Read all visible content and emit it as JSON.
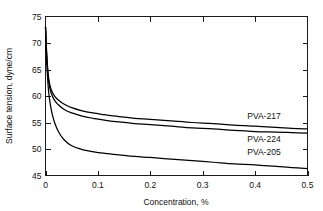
{
  "chart_data": {
    "type": "line",
    "title": "",
    "subtitle": "",
    "xlabel": "Concentration, %",
    "ylabel": "Surface tension, dyne/cm",
    "xlim": [
      0,
      0.5
    ],
    "ylim": [
      45,
      75
    ],
    "xticks": [
      0,
      0.1,
      0.2,
      0.3,
      0.4,
      0.5
    ],
    "xticklabels": [
      "0",
      "0.1",
      "0.2",
      "0.3",
      "0.4",
      "0.5"
    ],
    "yticks": [
      45,
      50,
      55,
      60,
      65,
      70,
      75
    ],
    "yticklabels": [
      "45",
      "50",
      "55",
      "60",
      "65",
      "70",
      "75"
    ],
    "grid": false,
    "legend_position": "inline-right",
    "frame": "full-box",
    "tick_direction": "in",
    "line_color": "#000000",
    "background_color": "#ffffff",
    "series": [
      {
        "name": "PVA-217",
        "label_x": 0.385,
        "label_y": 56.2,
        "x": [
          0,
          0.002,
          0.004,
          0.006,
          0.009,
          0.013,
          0.018,
          0.025,
          0.035,
          0.05,
          0.07,
          0.09,
          0.11,
          0.14,
          0.17,
          0.2,
          0.24,
          0.28,
          0.32,
          0.36,
          0.4,
          0.44,
          0.47,
          0.5
        ],
        "y": [
          73.0,
          68.5,
          65.4,
          63.4,
          61.8,
          60.7,
          59.9,
          59.2,
          58.5,
          57.8,
          57.2,
          56.8,
          56.5,
          56.1,
          55.8,
          55.6,
          55.3,
          55.0,
          54.8,
          54.5,
          54.3,
          54.1,
          53.9,
          53.8
        ]
      },
      {
        "name": "PVA-224",
        "label_x": 0.385,
        "label_y": 51.8,
        "x": [
          0,
          0.002,
          0.004,
          0.006,
          0.009,
          0.013,
          0.018,
          0.025,
          0.035,
          0.05,
          0.07,
          0.09,
          0.11,
          0.14,
          0.17,
          0.2,
          0.24,
          0.28,
          0.32,
          0.36,
          0.4,
          0.44,
          0.47,
          0.5
        ],
        "y": [
          73.0,
          68.2,
          64.9,
          62.8,
          61.2,
          60.0,
          59.1,
          58.3,
          57.5,
          56.8,
          56.2,
          55.8,
          55.5,
          55.1,
          54.8,
          54.6,
          54.3,
          54.0,
          53.8,
          53.5,
          53.3,
          53.2,
          53.1,
          53.0
        ]
      },
      {
        "name": "PVA-205",
        "label_x": 0.385,
        "label_y": 49.4,
        "x": [
          0,
          0.002,
          0.004,
          0.006,
          0.009,
          0.013,
          0.018,
          0.025,
          0.035,
          0.05,
          0.07,
          0.09,
          0.11,
          0.14,
          0.17,
          0.2,
          0.24,
          0.28,
          0.32,
          0.36,
          0.4,
          0.44,
          0.47,
          0.5
        ],
        "y": [
          73.0,
          67.2,
          63.4,
          60.8,
          58.5,
          56.5,
          54.8,
          53.2,
          51.8,
          50.6,
          49.9,
          49.5,
          49.2,
          48.9,
          48.6,
          48.4,
          48.1,
          47.8,
          47.5,
          47.2,
          47.0,
          46.7,
          46.5,
          46.3
        ]
      }
    ]
  }
}
